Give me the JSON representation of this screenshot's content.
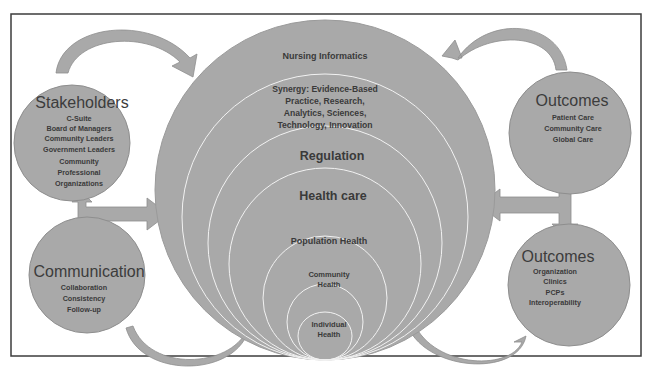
{
  "diagram": {
    "colors": {
      "fill": "#a9a9a9",
      "stroke": "#8e8e8e",
      "ring_line": "#f2f2f2",
      "text": "#3a3a3a",
      "frame": "#3c3c3c",
      "background": "#ffffff"
    },
    "center": {
      "title": "Nursing Informatics",
      "rings": [
        {
          "id": "synergy",
          "lines": [
            "Synergy: Evidence-Based",
            "Practice, Research,",
            "Analytics, Sciences,",
            "Technology, Innovation"
          ]
        },
        {
          "id": "regulation",
          "lines": [
            "Regulation"
          ]
        },
        {
          "id": "health-care",
          "lines": [
            "Health care"
          ]
        },
        {
          "id": "population-health",
          "lines": [
            "Population Health"
          ]
        },
        {
          "id": "community-health",
          "lines": [
            "Community",
            "Health"
          ]
        },
        {
          "id": "individual-health",
          "lines": [
            "Individual",
            "Health"
          ]
        }
      ]
    },
    "stakeholders": {
      "title": "Stakeholders",
      "items": [
        "C-Suite",
        "Board of Managers",
        "Community Leaders",
        "Government Leaders",
        "Community",
        "Professional",
        "Organizations"
      ]
    },
    "communication": {
      "title": "Communication",
      "items": [
        "Collaboration",
        "Consistency",
        "Follow-up"
      ]
    },
    "outcomes_top": {
      "title": "Outcomes",
      "items": [
        "Patient Care",
        "Community Care",
        "Global Care"
      ]
    },
    "outcomes_bottom": {
      "title": "Outcomes",
      "items": [
        "Organization",
        "Clinics",
        "PCPs",
        "Interoperability"
      ]
    }
  }
}
